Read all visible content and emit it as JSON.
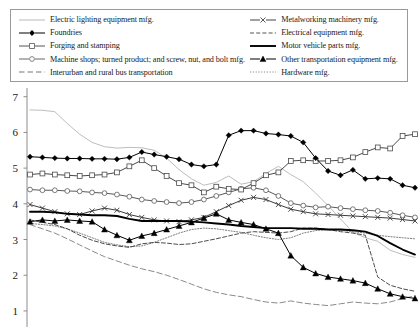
{
  "legend": {
    "left_column": [
      {
        "label": "Electric lighting equipment mfg.",
        "style": "solid-thin-lightgray",
        "marker": "none",
        "color": "#b9b9b9"
      },
      {
        "label": "Foundries",
        "style": "solid",
        "marker": "diamond-filled",
        "color": "#000000"
      },
      {
        "label": "Forging and stamping",
        "style": "solid",
        "marker": "square-open",
        "color": "#555555"
      },
      {
        "label": "Machine shops; turned product; and screw, nut, and bolt mfg.",
        "style": "solid",
        "marker": "circle-open",
        "color": "#666666"
      },
      {
        "label": "Interurban and rural bus transportation",
        "style": "dashed-long",
        "marker": "none",
        "color": "#777777"
      }
    ],
    "right_column": [
      {
        "label": "Metalworking machinery mfg.",
        "style": "solid",
        "marker": "x",
        "color": "#444444"
      },
      {
        "label": "Electrical equipment mfg.",
        "style": "dashed",
        "marker": "none",
        "color": "#555555"
      },
      {
        "label": "Motor vehicle parts mfg.",
        "style": "solid-thick",
        "marker": "none",
        "color": "#000000"
      },
      {
        "label": "Other transportation equipment mfg.",
        "style": "solid",
        "marker": "triangle-filled",
        "color": "#000000"
      },
      {
        "label": "Hardware mfg.",
        "style": "dotted",
        "marker": "none",
        "color": "#888888"
      }
    ]
  },
  "axis": {
    "y_ticks": [
      "7",
      "6",
      "5",
      "4",
      "3",
      "2",
      "1"
    ],
    "y_values": [
      7,
      6,
      5,
      4,
      3,
      2,
      1
    ],
    "ymin": 0.55,
    "ymax": 7.3
  },
  "chart_data": {
    "type": "line",
    "title": "",
    "xlabel": "",
    "ylabel": "",
    "ylim": [
      0.55,
      7.3
    ],
    "grid": false,
    "legend_position": "top",
    "x": [
      0,
      1,
      2,
      3,
      4,
      5,
      6,
      7,
      8,
      9,
      10,
      11,
      12,
      13,
      14,
      15,
      16,
      17,
      18,
      19,
      20,
      21,
      22,
      23,
      24,
      25,
      26,
      27,
      28,
      29,
      30,
      31
    ],
    "series": [
      {
        "name": "Electric lighting equipment mfg.",
        "style": "solid-thin-lightgray",
        "marker": "none",
        "color": "#bdbdbd",
        "width": 1,
        "values": [
          6.63,
          6.62,
          6.58,
          6.25,
          5.95,
          5.72,
          5.6,
          5.56,
          5.58,
          5.57,
          5.5,
          5.28,
          4.96,
          4.7,
          4.52,
          4.6,
          4.78,
          4.55,
          4.62,
          4.85,
          5.05,
          4.82,
          4.62,
          4.3,
          3.95,
          3.58,
          3.2,
          3.05,
          2.95,
          2.7,
          2.58,
          2.5
        ]
      },
      {
        "name": "Foundries",
        "style": "solid",
        "marker": "diamond-filled",
        "color": "#000000",
        "width": 1,
        "values": [
          5.32,
          5.3,
          5.28,
          5.27,
          5.27,
          5.26,
          5.26,
          5.25,
          5.3,
          5.45,
          5.38,
          5.32,
          5.25,
          5.1,
          5.05,
          5.1,
          5.92,
          6.05,
          6.05,
          5.97,
          5.94,
          5.9,
          5.72,
          5.28,
          4.92,
          4.8,
          4.95,
          4.7,
          4.72,
          4.7,
          4.52,
          4.45
        ]
      },
      {
        "name": "Forging and stamping",
        "style": "solid",
        "marker": "square-open",
        "color": "#4a4a4a",
        "width": 1,
        "values": [
          4.82,
          4.85,
          4.82,
          4.8,
          4.78,
          4.8,
          4.82,
          4.88,
          5.05,
          5.22,
          5.0,
          4.78,
          4.58,
          4.52,
          4.32,
          4.48,
          4.42,
          4.4,
          4.58,
          4.8,
          4.88,
          5.2,
          5.22,
          5.2,
          5.2,
          5.22,
          5.3,
          5.45,
          5.58,
          5.55,
          5.9,
          5.95
        ]
      },
      {
        "name": "Machine shops; turned product; and screw, nut, and bolt mfg.",
        "style": "solid",
        "marker": "circle-open",
        "color": "#5a5a5a",
        "width": 1,
        "values": [
          4.4,
          4.38,
          4.38,
          4.36,
          4.35,
          4.32,
          4.3,
          4.26,
          4.2,
          4.12,
          4.08,
          4.05,
          4.02,
          4.05,
          4.12,
          4.22,
          4.32,
          4.42,
          4.45,
          4.38,
          4.22,
          4.02,
          3.95,
          3.9,
          3.92,
          3.88,
          3.85,
          3.82,
          3.8,
          3.75,
          3.68,
          3.62
        ]
      },
      {
        "name": "Metalworking machinery mfg.",
        "style": "solid",
        "marker": "x",
        "color": "#3c3c3c",
        "width": 1,
        "values": [
          3.98,
          3.88,
          3.78,
          3.72,
          3.7,
          3.8,
          3.88,
          3.82,
          3.7,
          3.62,
          3.55,
          3.52,
          3.5,
          3.55,
          3.62,
          3.78,
          3.95,
          4.1,
          4.18,
          4.12,
          3.98,
          3.85,
          3.78,
          3.72,
          3.7,
          3.68,
          3.66,
          3.64,
          3.62,
          3.6,
          3.56,
          3.52
        ]
      },
      {
        "name": "Motor vehicle parts mfg.",
        "style": "solid-thick",
        "marker": "none",
        "color": "#000000",
        "width": 1.9,
        "values": [
          3.78,
          3.78,
          3.76,
          3.72,
          3.7,
          3.68,
          3.68,
          3.66,
          3.58,
          3.52,
          3.52,
          3.52,
          3.52,
          3.5,
          3.48,
          3.45,
          3.42,
          3.38,
          3.35,
          3.32,
          3.32,
          3.32,
          3.3,
          3.3,
          3.28,
          3.28,
          3.26,
          3.22,
          3.1,
          2.9,
          2.72,
          2.58
        ]
      },
      {
        "name": "Other transportation equipment mfg.",
        "style": "solid",
        "marker": "triangle-filled",
        "color": "#000000",
        "width": 1,
        "values": [
          3.5,
          3.55,
          3.52,
          3.55,
          3.52,
          3.5,
          3.28,
          3.12,
          2.98,
          3.1,
          3.18,
          3.28,
          3.38,
          3.48,
          3.6,
          3.72,
          3.55,
          3.48,
          3.42,
          3.3,
          3.18,
          2.55,
          2.22,
          2.05,
          1.95,
          1.9,
          1.85,
          1.78,
          1.62,
          1.48,
          1.4,
          1.35
        ]
      },
      {
        "name": "Electrical equipment mfg.",
        "style": "dashed",
        "marker": "none",
        "color": "#4e4e4e",
        "width": 1,
        "values": [
          3.55,
          3.48,
          3.42,
          3.3,
          3.12,
          2.98,
          2.88,
          2.82,
          2.78,
          2.88,
          2.92,
          2.9,
          2.86,
          2.88,
          2.95,
          3.02,
          3.1,
          3.18,
          3.22,
          3.2,
          3.18,
          3.22,
          3.32,
          3.32,
          3.28,
          3.22,
          3.18,
          3.12,
          1.95,
          1.72,
          1.62,
          1.55
        ]
      },
      {
        "name": "Hardware mfg.",
        "style": "dotted",
        "marker": "none",
        "color": "#7d7d7d",
        "width": 1,
        "values": [
          3.45,
          3.42,
          3.38,
          3.3,
          3.18,
          3.05,
          2.92,
          2.85,
          2.8,
          2.82,
          2.92,
          3.05,
          3.18,
          3.28,
          3.32,
          3.3,
          3.25,
          3.2,
          3.12,
          3.05,
          3.0,
          3.05,
          3.18,
          3.25,
          3.28,
          3.26,
          3.22,
          3.18,
          3.12,
          3.08,
          3.05,
          3.02
        ]
      },
      {
        "name": "Interurban and rural bus transportation",
        "style": "dashed-long",
        "marker": "none",
        "color": "#8a8a8a",
        "width": 1,
        "values": [
          3.42,
          3.3,
          3.18,
          3.02,
          2.85,
          2.68,
          2.52,
          2.4,
          2.28,
          2.18,
          2.1,
          2.0,
          1.88,
          1.75,
          1.62,
          1.52,
          1.45,
          1.4,
          1.32,
          1.25,
          1.22,
          1.28,
          1.22,
          1.18,
          1.15,
          1.2,
          1.25,
          1.22,
          1.2,
          1.25,
          1.35,
          1.42
        ]
      }
    ]
  }
}
